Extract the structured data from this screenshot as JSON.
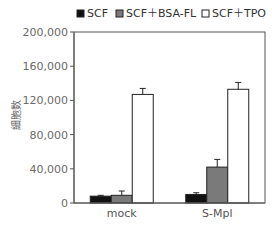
{
  "chart_data": {
    "type": "bar",
    "title": "",
    "xlabel": "",
    "ylabel": "細胞数",
    "categories": [
      "mock",
      "S-Mpl"
    ],
    "series": [
      {
        "name": "SCF",
        "color": "#111111",
        "values": [
          8000,
          10000
        ],
        "errors": [
          1000,
          2000
        ]
      },
      {
        "name": "SCF＋BSA-FL",
        "color": "#7a7a7a",
        "values": [
          9000,
          42000
        ],
        "errors": [
          5000,
          9000
        ]
      },
      {
        "name": "SCF＋TPO",
        "color": "#ffffff",
        "values": [
          127000,
          133000
        ],
        "errors": [
          7000,
          8000
        ]
      }
    ],
    "ylim": [
      0,
      200000
    ],
    "yticks": [
      0,
      40000,
      80000,
      120000,
      160000,
      200000
    ],
    "ytick_labels": [
      "0",
      "40,000",
      "80,000",
      "120,000",
      "160,000",
      "200,000"
    ],
    "grid": false,
    "legend_position": "top"
  }
}
